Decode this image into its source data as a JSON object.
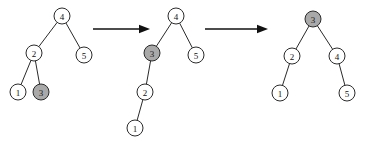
{
  "figure": {
    "background_color": "#ffffff",
    "node_fill_plain": "#ffffff",
    "node_fill_shaded": "#a9a9a9",
    "node_stroke": "#2b2b2b",
    "edge_color": "#2a2a2a",
    "arrow_color": "#111111",
    "node_radius": 8
  },
  "trees": [
    {
      "id": "tree-1",
      "caption": "",
      "nodes": [
        {
          "id": "t1-n4",
          "label": "4",
          "x": 62,
          "y": 16,
          "shaded": false
        },
        {
          "id": "t1-n2",
          "label": "2",
          "x": 34,
          "y": 53,
          "shaded": false
        },
        {
          "id": "t1-n5",
          "label": "5",
          "x": 84,
          "y": 55,
          "shaded": false
        },
        {
          "id": "t1-n1",
          "label": "1",
          "x": 18,
          "y": 92,
          "shaded": false
        },
        {
          "id": "t1-n3",
          "label": "3",
          "x": 41,
          "y": 92,
          "shaded": true
        }
      ],
      "edges": [
        {
          "from": "t1-n4",
          "to": "t1-n2"
        },
        {
          "from": "t1-n4",
          "to": "t1-n5"
        },
        {
          "from": "t1-n2",
          "to": "t1-n1"
        },
        {
          "from": "t1-n2",
          "to": "t1-n3"
        }
      ]
    },
    {
      "id": "tree-2",
      "caption": "",
      "nodes": [
        {
          "id": "t2-n4",
          "label": "4",
          "x": 176,
          "y": 16,
          "shaded": false
        },
        {
          "id": "t2-n3",
          "label": "3",
          "x": 152,
          "y": 53,
          "shaded": true
        },
        {
          "id": "t2-n5",
          "label": "5",
          "x": 196,
          "y": 55,
          "shaded": false
        },
        {
          "id": "t2-n2",
          "label": "2",
          "x": 145,
          "y": 92,
          "shaded": false
        },
        {
          "id": "t2-n1",
          "label": "1",
          "x": 135,
          "y": 128,
          "shaded": false
        }
      ],
      "edges": [
        {
          "from": "t2-n4",
          "to": "t2-n3"
        },
        {
          "from": "t2-n4",
          "to": "t2-n5"
        },
        {
          "from": "t2-n3",
          "to": "t2-n2"
        },
        {
          "from": "t2-n2",
          "to": "t2-n1"
        }
      ]
    },
    {
      "id": "tree-3",
      "caption": "",
      "nodes": [
        {
          "id": "t3-n3",
          "label": "3",
          "x": 313,
          "y": 19,
          "shaded": true
        },
        {
          "id": "t3-n2",
          "label": "2",
          "x": 292,
          "y": 56,
          "shaded": false
        },
        {
          "id": "t3-n4",
          "label": "4",
          "x": 337,
          "y": 56,
          "shaded": false
        },
        {
          "id": "t3-n1",
          "label": "1",
          "x": 280,
          "y": 93,
          "shaded": false
        },
        {
          "id": "t3-n5",
          "label": "5",
          "x": 347,
          "y": 93,
          "shaded": false
        }
      ],
      "edges": [
        {
          "from": "t3-n3",
          "to": "t3-n2"
        },
        {
          "from": "t3-n3",
          "to": "t3-n4"
        },
        {
          "from": "t3-n2",
          "to": "t3-n1"
        },
        {
          "from": "t3-n4",
          "to": "t3-n5"
        }
      ]
    }
  ],
  "arrows": [
    {
      "id": "arrow-1",
      "label": "",
      "x1": 93,
      "y1": 29,
      "x2": 150,
      "y2": 29
    },
    {
      "id": "arrow-2",
      "label": "",
      "x1": 205,
      "y1": 29,
      "x2": 268,
      "y2": 29
    }
  ]
}
